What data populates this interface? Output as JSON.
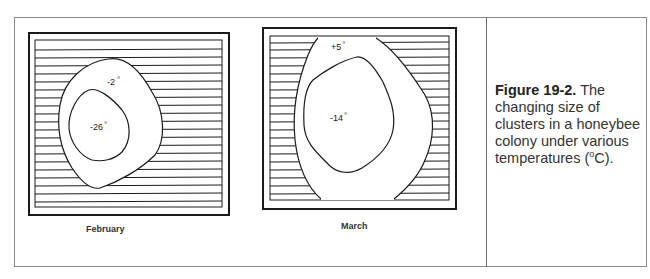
{
  "figure": {
    "panels": [
      {
        "month_label": "February",
        "outer_contour_temp": "-2",
        "inner_contour_temp": "-26",
        "degree_symbol": "°"
      },
      {
        "month_label": "March",
        "outer_contour_temp": "+5",
        "inner_contour_temp": "-14",
        "degree_symbol": "°"
      }
    ],
    "caption": {
      "figure_number": "Figure 19-2.",
      "text_before_unit": " The changing size of clusters in a honeybee colony under various temperatures (",
      "unit_superscript": "o",
      "text_after_unit": "C)."
    }
  },
  "colors": {
    "line": "#1a1a1a",
    "frame": "#8a8a8a",
    "background": "#ffffff"
  }
}
